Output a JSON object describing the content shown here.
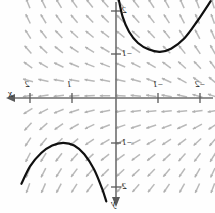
{
  "figure": {
    "kind": "slope-field",
    "orientation": "horizontally-mirrored",
    "background_color": "#fefefe",
    "axis_color": "#6e6e6e",
    "slope_color": "#b9b9b9",
    "curve_color": "#101010"
  },
  "axes": {
    "x_label": "x",
    "y_label": "y",
    "x_arrow_direction": "left",
    "y_arrow_direction": "down",
    "origin_px": {
      "x": 116,
      "y": 98
    },
    "unit_px": 44
  },
  "x_ticks": [
    {
      "label": "2",
      "value": 2,
      "px": 30
    },
    {
      "label": "1",
      "value": 1,
      "px": 72
    },
    {
      "label": "1",
      "value": -1,
      "px": 158
    },
    {
      "label": "2",
      "value": -2,
      "px": 200
    }
  ],
  "x_tick_signs": [
    {
      "label": "",
      "value": 2
    },
    {
      "label": "",
      "value": 1
    },
    {
      "label": "−",
      "value": -1
    },
    {
      "label": "−",
      "value": -2
    }
  ],
  "y_ticks": [
    {
      "label": "2",
      "value": 2,
      "px": 11
    },
    {
      "label": "1",
      "value": 1,
      "px": 54
    },
    {
      "label": "1",
      "value": -1,
      "px": 143
    },
    {
      "label": "2",
      "value": -2,
      "px": 187
    }
  ],
  "y_tick_signs": [
    {
      "label": "",
      "value": 2
    },
    {
      "label": "−",
      "value": 1
    },
    {
      "label": "−",
      "value": -1
    },
    {
      "label": "",
      "value": -2
    }
  ],
  "chart_data": {
    "type": "line",
    "title": "",
    "xlabel": "x",
    "ylabel": "y",
    "xlim": [
      -2.4,
      2.4
    ],
    "ylim": [
      -2.4,
      2.4
    ],
    "grid": false,
    "legend": "none",
    "mirrored": true,
    "series": [
      {
        "name": "solution-curve-upper-right",
        "shape": "upward-opening-parabola",
        "points": [
          [
            -0.05,
            2.3
          ],
          [
            -0.15,
            1.85
          ],
          [
            -0.3,
            1.5
          ],
          [
            -0.5,
            1.25
          ],
          [
            -0.75,
            1.1
          ],
          [
            -1.0,
            1.05
          ],
          [
            -1.25,
            1.12
          ],
          [
            -1.55,
            1.35
          ],
          [
            -1.85,
            1.75
          ],
          [
            -2.15,
            2.2
          ]
        ]
      },
      {
        "name": "solution-curve-lower-left",
        "shape": "downward-opening-parabola",
        "points": [
          [
            2.15,
            -1.95
          ],
          [
            1.95,
            -1.55
          ],
          [
            1.7,
            -1.25
          ],
          [
            1.45,
            -1.08
          ],
          [
            1.2,
            -1.02
          ],
          [
            0.95,
            -1.08
          ],
          [
            0.72,
            -1.28
          ],
          [
            0.5,
            -1.62
          ],
          [
            0.32,
            -2.05
          ],
          [
            0.22,
            -2.35
          ]
        ]
      }
    ],
    "slope_field": {
      "description": "short grey tangent dashes on a uniform grid",
      "x_samples": [
        -2.2,
        -1.85,
        -1.5,
        -1.15,
        -0.8,
        -0.45,
        -0.1,
        0.25,
        0.6,
        0.95,
        1.3,
        1.65,
        2.0
      ],
      "y_samples": [
        2.15,
        1.8,
        1.45,
        1.1,
        0.75,
        0.4,
        0.05,
        -0.3,
        -0.65,
        -1.0,
        -1.35,
        -1.7,
        -2.05
      ],
      "behavior": "slopes nearly horizontal near the origin, steepening toward the upper-left and lower-right corners"
    }
  }
}
